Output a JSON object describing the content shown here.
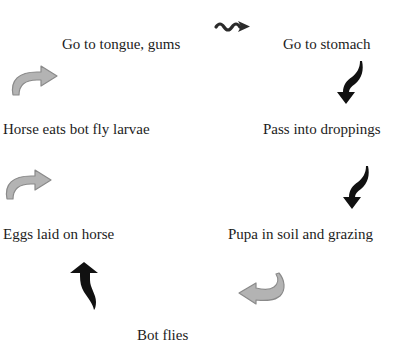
{
  "diagram": {
    "type": "life-cycle",
    "stages": [
      {
        "id": "tongue",
        "label": "Go to tongue, gums"
      },
      {
        "id": "stomach",
        "label": "Go to stomach"
      },
      {
        "id": "larvae",
        "label": "Horse eats bot fly larvae"
      },
      {
        "id": "droppings",
        "label": "Pass into droppings"
      },
      {
        "id": "eggs",
        "label": "Eggs laid on horse"
      },
      {
        "id": "pupa",
        "label": "Pupa in soil and grazing"
      },
      {
        "id": "flies",
        "label": "Bot flies"
      }
    ],
    "arrows": [
      {
        "name": "wavy-arrow-icon",
        "from": "tongue",
        "to": "stomach",
        "color": "#2b2b2b"
      },
      {
        "name": "curved-arrow-down-icon",
        "from": "stomach",
        "to": "droppings",
        "color": "#111111"
      },
      {
        "name": "curved-arrow-down-icon",
        "from": "droppings",
        "to": "pupa",
        "color": "#111111"
      },
      {
        "name": "curved-arrow-left-icon",
        "from": "pupa",
        "to": "flies",
        "color": "#a9a9a9"
      },
      {
        "name": "curved-arrow-up-icon",
        "from": "flies",
        "to": "eggs",
        "color": "#111111"
      },
      {
        "name": "curved-arrow-right-icon",
        "from": "eggs",
        "to": "larvae",
        "color": "#a9a9a9"
      },
      {
        "name": "curved-arrow-right-icon",
        "from": "larvae",
        "to": "tongue",
        "color": "#a9a9a9"
      }
    ],
    "colors": {
      "background": "#ffffff",
      "text": "#1c1c1c",
      "dark_arrow": "#111111",
      "gray_arrow_fill": "#b3b3b3",
      "gray_arrow_stroke": "#8a8a8a"
    }
  }
}
